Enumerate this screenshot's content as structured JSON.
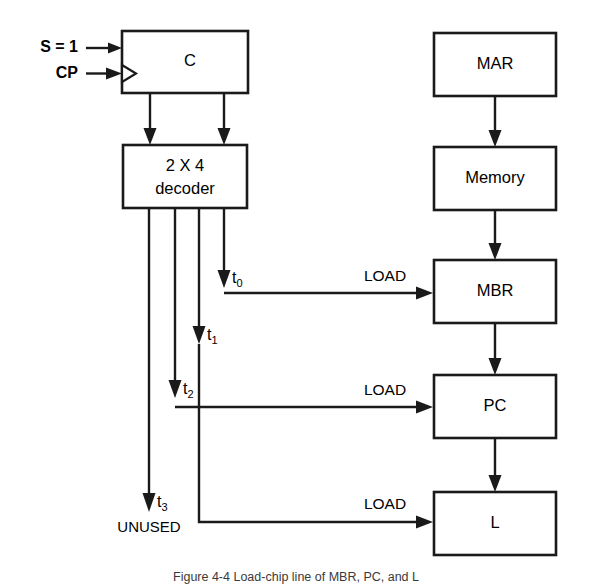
{
  "figure": {
    "caption": "Figure 4-4  Load-chip line of MBR, PC, and L",
    "background_color": "#ffffff",
    "line_color": "#1a1a1a"
  },
  "inputs": [
    {
      "label": "S = 1",
      "target": "C"
    },
    {
      "label": "CP",
      "target": "C",
      "clocked": true
    }
  ],
  "boxes": [
    {
      "id": "counter",
      "label": "C"
    },
    {
      "id": "decoder",
      "label_line1": "2 X 4",
      "label_line2": "decoder"
    },
    {
      "id": "mar",
      "label": "MAR"
    },
    {
      "id": "memory",
      "label": "Memory"
    },
    {
      "id": "mbr",
      "label": "MBR"
    },
    {
      "id": "pc",
      "label": "PC"
    },
    {
      "id": "l",
      "label": "L"
    }
  ],
  "timing_signals": [
    {
      "id": "t0",
      "base": "t",
      "sub": "0",
      "destination": "MBR"
    },
    {
      "id": "t1",
      "base": "t",
      "sub": "1",
      "destination": ""
    },
    {
      "id": "t2",
      "base": "t",
      "sub": "2",
      "destination": "PC"
    },
    {
      "id": "t3",
      "base": "t",
      "sub": "3",
      "destination": "UNUSED"
    }
  ],
  "load_labels": [
    {
      "id": "load-mbr",
      "label": "LOAD"
    },
    {
      "id": "load-pc",
      "label": "LOAD"
    },
    {
      "id": "load-l",
      "label": "LOAD"
    }
  ],
  "unused_label": "UNUSED",
  "icons": {
    "clock_input": "clock-triangle-icon",
    "arrow": "arrowhead-icon"
  }
}
